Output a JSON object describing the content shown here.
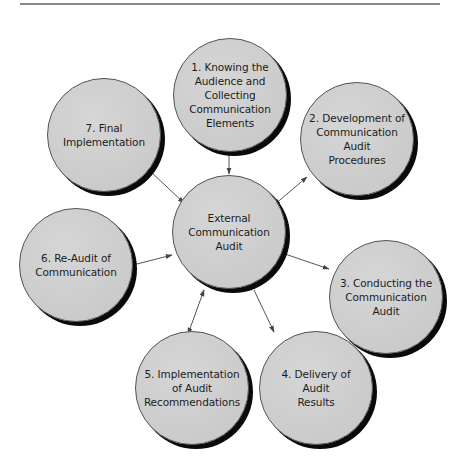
{
  "diagram": {
    "top_rule": true,
    "colors": {
      "node_fill": "#cfcfcf",
      "node_shadow": "#0a0a0a",
      "node_border": "#555555",
      "arrow": "#444444",
      "text": "#1c1c1c",
      "rule": "#8a8a8a"
    },
    "center": {
      "label": "External\nCommunication Audit"
    },
    "nodes": [
      {
        "id": "1",
        "label": "1. Knowing the\nAudience and\nCollecting\nCommunication\nElements"
      },
      {
        "id": "2",
        "label": "2. Development of\nCommunication Audit\nProcedures"
      },
      {
        "id": "3",
        "label": "3. Conducting the\nCommunication Audit"
      },
      {
        "id": "4",
        "label": "4. Delivery of Audit\nResults"
      },
      {
        "id": "5",
        "label": "5. Implementation\nof Audit\nRecommendations"
      },
      {
        "id": "6",
        "label": "6. Re-Audit of\nCommunication"
      },
      {
        "id": "7",
        "label": "7. Final\nImplementation"
      }
    ],
    "edges": [
      {
        "from": "1",
        "to": "center",
        "direction": "one-way"
      },
      {
        "from": "2",
        "to": "center",
        "direction": "bidirectional"
      },
      {
        "from": "center",
        "to": "3",
        "direction": "one-way"
      },
      {
        "from": "center",
        "to": "4",
        "direction": "one-way"
      },
      {
        "from": "center",
        "to": "5",
        "direction": "bidirectional"
      },
      {
        "from": "6",
        "to": "center",
        "direction": "one-way"
      },
      {
        "from": "7",
        "to": "center",
        "direction": "one-way"
      }
    ]
  }
}
